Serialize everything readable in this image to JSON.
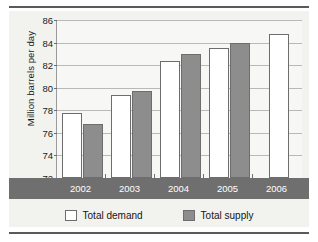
{
  "chart_data": {
    "type": "bar",
    "title": "",
    "xlabel": "",
    "ylabel": "Million barrels per day",
    "categories": [
      "2002",
      "2003",
      "2004",
      "2005",
      "2006"
    ],
    "series": [
      {
        "name": "Total demand",
        "color": "#ffffff",
        "values": [
          77.8,
          79.4,
          82.4,
          83.5,
          84.8
        ]
      },
      {
        "name": "Total supply",
        "color": "#8d8d8d",
        "values": [
          76.8,
          79.7,
          83.0,
          84.0,
          null
        ]
      }
    ],
    "ylim": [
      72,
      86
    ],
    "yticks": [
      72,
      74,
      76,
      78,
      80,
      82,
      84,
      86
    ],
    "ytick_labels": [
      "72",
      "74",
      "76",
      "78",
      "80",
      "82",
      "84",
      "86"
    ],
    "grid": true,
    "legend_position": "bottom"
  },
  "legend": {
    "items": [
      {
        "label": "Total demand",
        "swatch": "demand"
      },
      {
        "label": "Total supply",
        "swatch": "supply"
      }
    ]
  },
  "colors": {
    "supply_fill": "#8d8d8d",
    "demand_fill": "#ffffff",
    "bar_outline": "#6d6d6d",
    "axis_band": "#6f6f6f",
    "gridline": "#b9b9b9",
    "rule": "#5a5a5a",
    "plot_background": "#f7f7f5"
  }
}
